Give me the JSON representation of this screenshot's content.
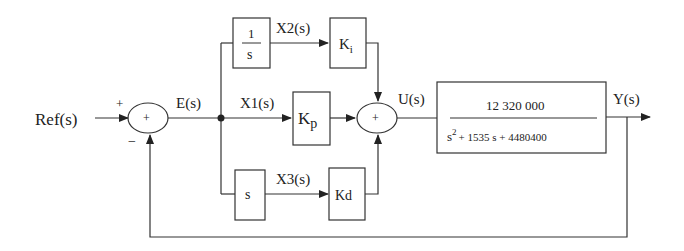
{
  "diagram": {
    "type": "block-diagram",
    "signals": {
      "ref": "Ref(s)",
      "error": "E(s)",
      "x1": "X1(s)",
      "x2": "X2(s)",
      "x3": "X3(s)",
      "control": "U(s)",
      "output": "Y(s)"
    },
    "sum1": {
      "center_sign": "+",
      "input_ref_sign": "+",
      "feedback_sign": "−"
    },
    "sum2": {
      "center_sign": "+"
    },
    "blocks": {
      "integrator": {
        "numerator": "1",
        "denominator": "s"
      },
      "ki": {
        "label": "K",
        "sub": "i"
      },
      "kp": {
        "label": "K",
        "sub": "p"
      },
      "differentiator": {
        "label": "s"
      },
      "kd": {
        "label": "Kd"
      },
      "plant": {
        "numerator": "12 320 000",
        "denominator_s2": "s",
        "denominator_exp": "2",
        "denominator_rest": "+ 1535 s + 4480400"
      }
    },
    "colors": {
      "line": "#333333",
      "text": "#222222",
      "background": "#ffffff"
    }
  }
}
